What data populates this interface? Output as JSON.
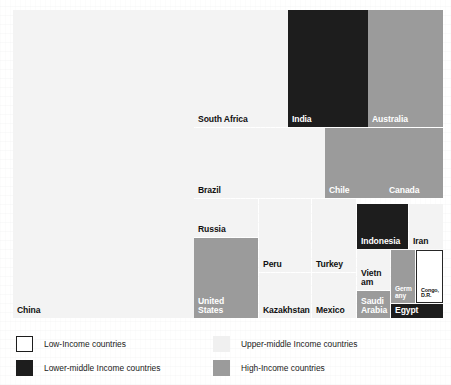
{
  "chart_data": {
    "type": "treemap",
    "title": "",
    "subtitle": "",
    "xlabel": "",
    "ylabel": "",
    "grid": false,
    "legend_position": "bottom",
    "color_key": {
      "low_income": "#ffffff",
      "lower_middle_income": "#1d1d1d",
      "upper_middle_income": "#f3f3f3",
      "high_income": "#9b9b9b"
    },
    "categories": [
      "China",
      "South Africa",
      "India",
      "Australia",
      "Brazil",
      "Chile",
      "Canada",
      "Russia",
      "Peru",
      "Turkey",
      "Indonesia",
      "Iran",
      "United States",
      "Kazakhstan",
      "Mexico",
      "Vietnam",
      "Germany",
      "Congo, D.R.",
      "Saudi Arabia",
      "Egypt"
    ],
    "nodes": [
      {
        "label": "China",
        "income_group": "upper-middle",
        "color": "#f3f3f3",
        "x": 13,
        "y": 10,
        "w": 181,
        "h": 308,
        "area_pct": 40.1
      },
      {
        "label": "South Africa",
        "income_group": "upper-middle",
        "color": "#f3f3f3",
        "x": 194,
        "y": 10,
        "w": 94,
        "h": 117,
        "area_pct": 8.0
      },
      {
        "label": "India",
        "income_group": "lower-middle",
        "color": "#1d1d1d",
        "x": 288,
        "y": 10,
        "w": 80,
        "h": 117,
        "area_pct": 6.8
      },
      {
        "label": "Australia",
        "income_group": "high",
        "color": "#9b9b9b",
        "x": 368,
        "y": 10,
        "w": 75,
        "h": 117,
        "area_pct": 6.4
      },
      {
        "label": "Brazil",
        "income_group": "upper-middle",
        "color": "#f3f3f3",
        "x": 194,
        "y": 128,
        "w": 131,
        "h": 70,
        "area_pct": 6.7
      },
      {
        "label": "Chile",
        "income_group": "high",
        "color": "#9b9b9b",
        "x": 325,
        "y": 128,
        "w": 60,
        "h": 70,
        "area_pct": 3.1
      },
      {
        "label": "Canada",
        "income_group": "high",
        "color": "#9b9b9b",
        "x": 385,
        "y": 128,
        "w": 58,
        "h": 70,
        "area_pct": 3.0
      },
      {
        "label": "Russia",
        "income_group": "upper-middle",
        "color": "#f3f3f3",
        "x": 194,
        "y": 199,
        "w": 64,
        "h": 38,
        "area_pct": 1.8
      },
      {
        "label": "United States",
        "income_group": "high",
        "color": "#9b9b9b",
        "x": 194,
        "y": 238,
        "w": 64,
        "h": 80,
        "area_pct": 3.7
      },
      {
        "label": "Peru",
        "income_group": "upper-middle",
        "color": "#f3f3f3",
        "x": 259,
        "y": 199,
        "w": 52,
        "h": 73,
        "area_pct": 2.7
      },
      {
        "label": "Turkey",
        "income_group": "upper-middle",
        "color": "#f3f3f3",
        "x": 312,
        "y": 199,
        "w": 44,
        "h": 73,
        "area_pct": 2.3
      },
      {
        "label": "Kazakhstan",
        "income_group": "upper-middle",
        "color": "#f3f3f3",
        "x": 259,
        "y": 273,
        "w": 52,
        "h": 45,
        "area_pct": 1.7
      },
      {
        "label": "Mexico",
        "income_group": "upper-middle",
        "color": "#f3f3f3",
        "x": 312,
        "y": 273,
        "w": 44,
        "h": 45,
        "area_pct": 1.4
      },
      {
        "label": "Indonesia",
        "income_group": "lower-middle",
        "color": "#1d1d1d",
        "x": 357,
        "y": 204,
        "w": 51,
        "h": 45,
        "area_pct": 1.6
      },
      {
        "label": "Iran",
        "income_group": "upper-middle",
        "color": "#f3f3f3",
        "x": 409,
        "y": 204,
        "w": 34,
        "h": 45,
        "area_pct": 1.1
      },
      {
        "label": "Vietnam",
        "income_group": "upper-middle",
        "color": "#f3f3f3",
        "x": 357,
        "y": 250,
        "w": 33,
        "h": 40,
        "area_pct": 0.8
      },
      {
        "label": "Saudi Arabia",
        "income_group": "high",
        "color": "#9b9b9b",
        "x": 357,
        "y": 291,
        "w": 33,
        "h": 27,
        "area_pct": 0.6
      },
      {
        "label": "Germany",
        "income_group": "high",
        "color": "#9b9b9b",
        "x": 391,
        "y": 250,
        "w": 24,
        "h": 53,
        "area_pct": 0.7
      },
      {
        "label": "Congo, D.R.",
        "income_group": "low",
        "color": "#ffffff",
        "x": 416,
        "y": 250,
        "w": 27,
        "h": 53,
        "area_pct": 0.8
      },
      {
        "label": "Egypt",
        "income_group": "lower-middle",
        "color": "#1d1d1d",
        "x": 391,
        "y": 304,
        "w": 52,
        "h": 14,
        "area_pct": 0.4
      }
    ]
  },
  "treemap": {
    "tiles": [
      {
        "name": "china",
        "label": "China",
        "font_size": 8.6,
        "text_tone": "dark"
      },
      {
        "name": "south-africa",
        "label": "South Africa",
        "font_size": 8.6,
        "text_tone": "dark"
      },
      {
        "name": "india",
        "label": "India",
        "font_size": 8.6,
        "text_tone": "light"
      },
      {
        "name": "australia",
        "label": "Australia",
        "font_size": 8.6,
        "text_tone": "light"
      },
      {
        "name": "brazil",
        "label": "Brazil",
        "font_size": 8.6,
        "text_tone": "dark"
      },
      {
        "name": "chile",
        "label": "Chile",
        "font_size": 8.6,
        "text_tone": "light"
      },
      {
        "name": "canada",
        "label": "Canada",
        "font_size": 8.6,
        "text_tone": "light"
      },
      {
        "name": "russia",
        "label": "Russia",
        "font_size": 8.6,
        "text_tone": "dark"
      },
      {
        "name": "united-states",
        "label": "United\nStates",
        "font_size": 8.6,
        "text_tone": "light"
      },
      {
        "name": "peru",
        "label": "Peru",
        "font_size": 8.6,
        "text_tone": "dark"
      },
      {
        "name": "turkey",
        "label": "Turkey",
        "font_size": 8.6,
        "text_tone": "dark"
      },
      {
        "name": "kazakhstan",
        "label": "Kazakhstan",
        "font_size": 8.6,
        "text_tone": "dark"
      },
      {
        "name": "mexico",
        "label": "Mexico",
        "font_size": 8.6,
        "text_tone": "dark"
      },
      {
        "name": "indonesia",
        "label": "Indonesia",
        "font_size": 8.6,
        "text_tone": "light"
      },
      {
        "name": "iran",
        "label": "Iran",
        "font_size": 8.6,
        "text_tone": "dark"
      },
      {
        "name": "vietnam",
        "label": "Vietn\nam",
        "font_size": 8.6,
        "text_tone": "dark"
      },
      {
        "name": "saudi-arabia",
        "label": "Saudi\nArabia",
        "font_size": 8.6,
        "text_tone": "light"
      },
      {
        "name": "germany",
        "label": "Germ\nany",
        "font_size": 6.6,
        "text_tone": "light"
      },
      {
        "name": "congo-dr",
        "label": "Congo,\nD.R.",
        "font_size": 5.4,
        "text_tone": "dark"
      },
      {
        "name": "egypt",
        "label": "Egypt",
        "font_size": 8.6,
        "text_tone": "light"
      }
    ]
  },
  "legend": {
    "items": [
      {
        "name": "low-income",
        "label": "Low-Income countries",
        "swatch": "sw-white",
        "col": 0,
        "row": 0
      },
      {
        "name": "lower-middle-income",
        "label": "Lower-middle Income countries",
        "swatch": "sw-dark",
        "col": 0,
        "row": 1
      },
      {
        "name": "upper-middle-income",
        "label": "Upper-middle Income countries",
        "swatch": "sw-upper",
        "col": 1,
        "row": 0
      },
      {
        "name": "high-income",
        "label": "High-Income countries",
        "swatch": "sw-gray",
        "col": 1,
        "row": 1
      }
    ]
  }
}
